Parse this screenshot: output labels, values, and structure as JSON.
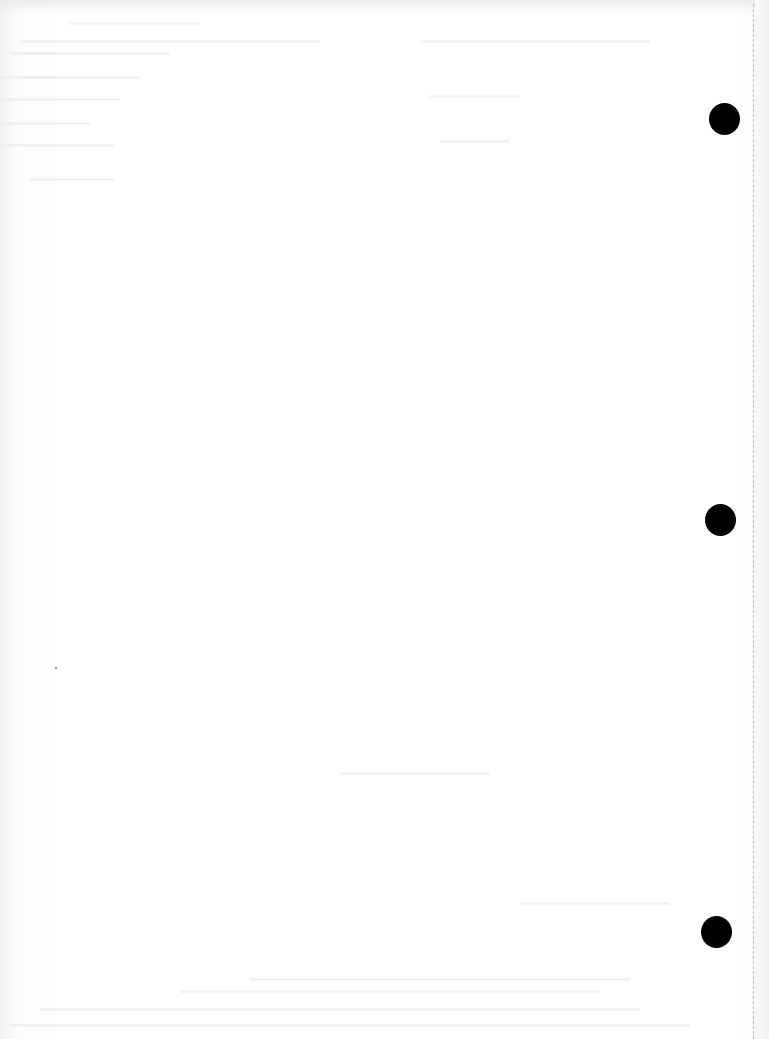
{
  "document": {
    "type": "blank scanned page",
    "background_color": "#ffffff",
    "text_content": "",
    "bleed_through_text_legible": false
  },
  "punch_holes": [
    {
      "cx": 724,
      "cy": 118,
      "r": 15,
      "color": "#000000"
    },
    {
      "cx": 720,
      "cy": 519,
      "r": 15,
      "color": "#000000"
    },
    {
      "cx": 716,
      "cy": 931,
      "r": 15,
      "color": "#000000"
    }
  ],
  "perforation_line": {
    "x": 753,
    "style": "dashed",
    "color": "#b9b9b9"
  }
}
